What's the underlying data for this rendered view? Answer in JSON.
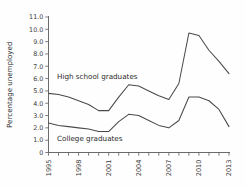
{
  "chart_data": {
    "type": "line",
    "title": "",
    "xlabel": "",
    "ylabel": "Percentage unemployed",
    "xlim": [
      1995,
      2013
    ],
    "ylim": [
      0,
      11
    ],
    "ytick_labels": [
      "11.0",
      "10.0",
      "9.0",
      "8.0",
      "7.0",
      "6.0",
      "5.0",
      "4.0",
      "3.0",
      "2.0",
      "1.0",
      "0"
    ],
    "ytick_values": [
      11,
      10,
      9,
      8,
      7,
      6,
      5,
      4,
      3,
      2,
      1,
      0
    ],
    "xtick_labels": [
      "1995",
      "1998",
      "2001",
      "2004",
      "2007",
      "2010",
      "2013"
    ],
    "xtick_values": [
      1995,
      1998,
      2001,
      2004,
      2007,
      2010,
      2013
    ],
    "x_minor_ticks": [
      1995,
      1996,
      1997,
      1998,
      1999,
      2000,
      2001,
      2002,
      2003,
      2004,
      2005,
      2006,
      2007,
      2008,
      2009,
      2010,
      2011,
      2012,
      2013
    ],
    "grid": false,
    "legend_position": "inline-annotations",
    "x": [
      1995,
      1996,
      1997,
      1998,
      1999,
      2000,
      2001,
      2002,
      2003,
      2004,
      2005,
      2006,
      2007,
      2008,
      2009,
      2010,
      2011,
      2012,
      2013
    ],
    "series": [
      {
        "name": "High school graduates",
        "color": "#4a4a4a",
        "values": [
          4.8,
          4.7,
          4.5,
          4.2,
          3.9,
          3.4,
          3.4,
          4.5,
          5.5,
          5.4,
          5.0,
          4.6,
          4.3,
          5.6,
          9.7,
          9.5,
          8.3,
          7.4,
          6.4
        ]
      },
      {
        "name": "College graduates",
        "color": "#4a4a4a",
        "values": [
          2.4,
          2.2,
          2.1,
          2.0,
          1.9,
          1.7,
          1.7,
          2.5,
          3.1,
          3.0,
          2.6,
          2.2,
          2.0,
          2.6,
          4.5,
          4.5,
          4.2,
          3.5,
          2.1
        ]
      }
    ],
    "annotations": [
      {
        "text": "High school graduates",
        "x_px": 57,
        "y_px": 79
      },
      {
        "text": "College graduates",
        "x_px": 57,
        "y_px": 141
      }
    ]
  },
  "caption": {
    "text": ""
  }
}
